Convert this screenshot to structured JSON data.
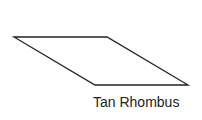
{
  "shape": {
    "type": "rhombus",
    "points": [
      [
        14,
        37
      ],
      [
        107,
        37
      ],
      [
        188,
        85
      ],
      [
        95,
        85
      ]
    ],
    "stroke": "#222222",
    "stroke_width": 1.3,
    "fill": "#ffffff"
  },
  "label": {
    "text": "Tan Rhombus"
  }
}
